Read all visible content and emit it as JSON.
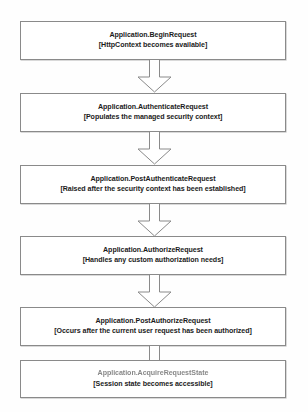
{
  "diagram": {
    "orientation": "vertical",
    "node_count": 6,
    "connector_count": 5,
    "colors": {
      "box_border": "#8a8a8a",
      "box_fill": "#ffffff",
      "arrow_stroke": "#8a8a8a",
      "arrow_fill": "#ffffff",
      "text": "#1b1b1b",
      "page_background": "#fefefe"
    },
    "nodes": [
      {
        "id": "begin-request",
        "title": "Application.BeginRequest",
        "subtitle": "[HttpContext becomes available]",
        "degraded": false
      },
      {
        "id": "authenticate-request",
        "title": "Application.AuthenticateRequest",
        "subtitle": "[Populates the managed security context]",
        "degraded": false
      },
      {
        "id": "post-authenticate-request",
        "title": "Application.PostAuthenticateRequest",
        "subtitle": "[Raised after the security context has been established]",
        "degraded": false
      },
      {
        "id": "authorize-request",
        "title": "Application.AuthorizeRequest",
        "subtitle": "[Handles any custom authorization needs]",
        "degraded": false
      },
      {
        "id": "post-authorize-request",
        "title": "Application.PostAuthorizeRequest",
        "subtitle": "[Occurs after the current user request has been authorized]",
        "degraded": false
      },
      {
        "id": "acquire-request-state",
        "title": "Application.AcquireRequestState",
        "subtitle": "[Session state becomes accessible]",
        "degraded": true
      }
    ],
    "connectors": [
      {
        "id": "arrow-1",
        "from": "begin-request",
        "to": "authenticate-request",
        "direction": "down"
      },
      {
        "id": "arrow-2",
        "from": "authenticate-request",
        "to": "post-authenticate-request",
        "direction": "down"
      },
      {
        "id": "arrow-3",
        "from": "post-authenticate-request",
        "to": "authorize-request",
        "direction": "down"
      },
      {
        "id": "arrow-4",
        "from": "authorize-request",
        "to": "post-authorize-request",
        "direction": "down"
      },
      {
        "id": "arrow-5",
        "from": "post-authorize-request",
        "to": "acquire-request-state",
        "direction": "down"
      }
    ]
  }
}
